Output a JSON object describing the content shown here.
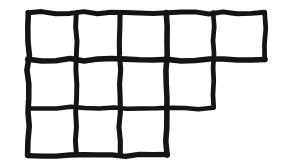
{
  "figure": {
    "kind": "hand-drawn-grid-polyomino",
    "background_color": "#ffffff",
    "stroke_color": "#141414",
    "stroke_width": 5,
    "canvas": {
      "width": 284,
      "height": 165
    },
    "cell_count": 12,
    "row_cell_counts": [
      5,
      4,
      3
    ],
    "column_count": 5,
    "x_lines": [
      28,
      76,
      120,
      167,
      213,
      265
    ],
    "y_lines": [
      13,
      60,
      108,
      155
    ],
    "rows": [
      {
        "index": 1,
        "cells": 5,
        "y_top": 13,
        "y_bottom": 60,
        "x_start": 28,
        "x_end": 265
      },
      {
        "index": 2,
        "cells": 4,
        "y_top": 60,
        "y_bottom": 108,
        "x_start": 28,
        "x_end": 213
      },
      {
        "index": 3,
        "cells": 3,
        "y_top": 108,
        "y_bottom": 155,
        "x_start": 28,
        "x_end": 167
      }
    ],
    "horizontal_segments": [
      {
        "name": "top-edge",
        "y": 13,
        "x1": 28,
        "x2": 265
      },
      {
        "name": "row1-row2-divider",
        "y": 60,
        "x1": 28,
        "x2": 265
      },
      {
        "name": "row2-row3-divider",
        "y": 108,
        "x1": 28,
        "x2": 213
      },
      {
        "name": "bottom-edge",
        "y": 155,
        "x1": 28,
        "x2": 167
      }
    ],
    "vertical_segments": [
      {
        "name": "col-line-1-left-edge",
        "x": 28,
        "y1": 13,
        "y2": 155
      },
      {
        "name": "col-line-2",
        "x": 76,
        "y1": 13,
        "y2": 155
      },
      {
        "name": "col-line-3",
        "x": 120,
        "y1": 13,
        "y2": 155
      },
      {
        "name": "col-line-4",
        "x": 167,
        "y1": 13,
        "y2": 155
      },
      {
        "name": "col-line-5",
        "x": 213,
        "y1": 13,
        "y2": 108
      },
      {
        "name": "col-line-6-right-edge",
        "x": 265,
        "y1": 13,
        "y2": 60
      }
    ]
  }
}
